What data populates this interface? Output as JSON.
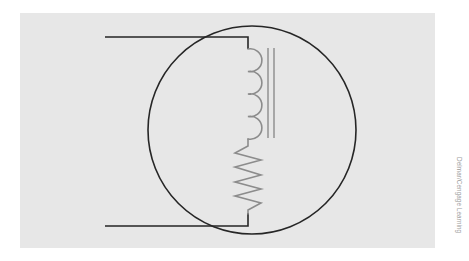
{
  "figure": {
    "kind": "electrical-schematic",
    "canvas": {
      "width": 469,
      "height": 261,
      "background": "#ffffff"
    },
    "panel": {
      "fill": "#e7e7e7",
      "x": 20,
      "y": 13,
      "width": 415,
      "height": 235
    },
    "colors": {
      "outline": "#262626",
      "lead": "#262626",
      "coil": "#8c8c8c",
      "core": "#8c8c8c",
      "resistor": "#8c8c8c",
      "credit": "#9a9a9a",
      "panel": "#e7e7e7",
      "page": "#ffffff"
    },
    "elements": {
      "enclosure_circle": {
        "label": "enclosure-circle",
        "cx": 252,
        "cy": 130,
        "r": 104,
        "stroke": "#262626",
        "stroke_width": 1.6
      },
      "top_lead": {
        "label": "top-terminal-lead",
        "points": "105,37 248,37 248,48",
        "stroke": "#262626",
        "stroke_width": 1.6
      },
      "bottom_lead": {
        "label": "bottom-terminal-lead",
        "points": "105,226 248,226 248,214",
        "stroke": "#262626",
        "stroke_width": 1.6
      },
      "coil": {
        "label": "inductor-coil",
        "turns": 4,
        "x": 248,
        "y_start": 48,
        "y_end": 138,
        "bump_radius": 11,
        "stroke": "#8c8c8c",
        "stroke_width": 1.5
      },
      "core_lines": {
        "label": "iron-core-lines",
        "count": 2,
        "x1": 268,
        "x2": 274,
        "y_top": 48,
        "y_bottom": 138,
        "stroke": "#8c8c8c",
        "stroke_width": 1.4
      },
      "resistor": {
        "label": "resistor-zigzag",
        "zigzags": 5,
        "x_center": 248,
        "amplitude": 13,
        "y_start": 140,
        "y_end": 214,
        "stroke": "#8c8c8c",
        "stroke_width": 1.5
      }
    }
  },
  "credit": {
    "text": "Delmar/Cengage Learning",
    "orientation": "vertical-rotated-90"
  }
}
